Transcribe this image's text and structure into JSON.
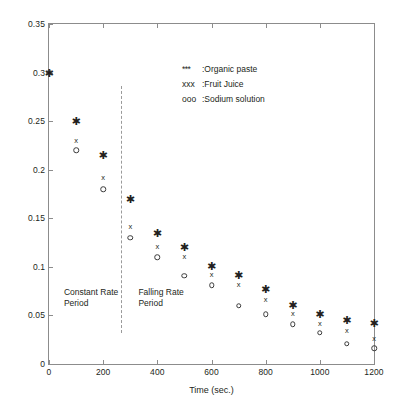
{
  "chart_data": {
    "type": "scatter",
    "title": "",
    "xlabel": "Time (sec.)",
    "ylabel": "Mositure Content (kg/kg)",
    "xlim": [
      0,
      1200
    ],
    "ylim": [
      0,
      0.35
    ],
    "grid": false,
    "legend_position": "upper right",
    "xticks": [
      "0",
      "200",
      "400",
      "600",
      "800",
      "1000",
      "1200"
    ],
    "xtick_values": [
      0,
      200,
      400,
      600,
      800,
      1000,
      1200
    ],
    "yticks": [
      "0",
      "0.05",
      "0.1",
      "0.15",
      "0.2",
      "0.25",
      "0.3",
      "0.35"
    ],
    "ytick_values": [
      0,
      0.05,
      0.1,
      0.15,
      0.2,
      0.25,
      0.3,
      0.35
    ],
    "x": [
      0,
      100,
      200,
      300,
      400,
      500,
      600,
      700,
      800,
      900,
      1000,
      1100,
      1200
    ],
    "series": [
      {
        "name": "Organic paste",
        "marker": "star",
        "legend_symbol": "***",
        "legend_label": ":Organic paste",
        "values": [
          0.3,
          0.25,
          0.215,
          0.17,
          0.135,
          0.12,
          0.101,
          0.092,
          0.077,
          0.061,
          0.051,
          0.045,
          0.042
        ]
      },
      {
        "name": "Fruit Juice",
        "marker": "x",
        "legend_symbol": "xxx",
        "legend_label": ":Fruit Juice",
        "values": [
          0.3,
          0.23,
          0.191,
          0.141,
          0.12,
          0.11,
          0.092,
          0.081,
          0.066,
          0.051,
          0.041,
          0.034,
          0.026
        ]
      },
      {
        "name": "Sodium solution",
        "marker": "o",
        "legend_symbol": "ooo",
        "legend_label": ":Sodium solution",
        "values": [
          0.3,
          0.22,
          0.18,
          0.13,
          0.11,
          0.091,
          0.081,
          0.06,
          0.051,
          0.041,
          0.032,
          0.021,
          0.016
        ]
      }
    ],
    "annotations": [
      {
        "text": "Constant Rate\nPeriod",
        "x": 55,
        "y": 0.079
      },
      {
        "text": "Falling Rate\nPeriod",
        "x": 330,
        "y": 0.079
      }
    ],
    "vertical_divider": {
      "x": 265,
      "y_top": 0.286,
      "y_bottom": 0.032,
      "style": "dashed"
    }
  },
  "colors": {
    "axis": "#8c8c8c",
    "marker": "#231f20",
    "divider": "#9a9a9a",
    "background": "#ffffff"
  }
}
